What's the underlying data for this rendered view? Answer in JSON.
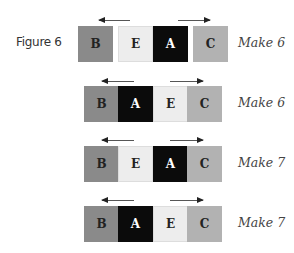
{
  "figure_label": "Figure 6",
  "colors": {
    "B": "#8a8a8a",
    "A": "#0b0b0b",
    "E": "#ededed",
    "C": "#b2b2b2"
  },
  "text_colors": {
    "B": "#222222",
    "A": "#ffffff",
    "E": "#222222",
    "C": "#222222"
  },
  "rows": [
    {
      "order": [
        "B",
        "E",
        "A",
        "C"
      ],
      "result": "Make 6"
    },
    {
      "order": [
        "B",
        "A",
        "E",
        "C"
      ],
      "result": "Make 6"
    },
    {
      "order": [
        "B",
        "E",
        "A",
        "C"
      ],
      "result": "Make 7"
    },
    {
      "order": [
        "B",
        "A",
        "E",
        "C"
      ],
      "result": "Make 7"
    }
  ],
  "arrows": {
    "left": "arrow-left",
    "right": "arrow-right"
  }
}
